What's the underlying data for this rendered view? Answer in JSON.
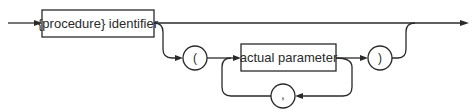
{
  "diagram": {
    "type": "syntax-diagram",
    "nodes": {
      "procedure_identifier": {
        "label": "{procedure} identifier",
        "kind": "nonterminal"
      },
      "open_paren": {
        "label": "(",
        "kind": "terminal"
      },
      "actual_parameter": {
        "label": "actual parameter",
        "kind": "nonterminal"
      },
      "comma": {
        "label": ",",
        "kind": "terminal"
      },
      "close_paren": {
        "label": ")",
        "kind": "terminal"
      }
    },
    "edges": [
      {
        "from": "entry",
        "to": "procedure_identifier"
      },
      {
        "from": "procedure_identifier",
        "to": "exit"
      },
      {
        "from": "procedure_identifier",
        "to": "open_paren"
      },
      {
        "from": "open_paren",
        "to": "actual_parameter"
      },
      {
        "from": "actual_parameter",
        "to": "close_paren"
      },
      {
        "from": "actual_parameter",
        "to": "comma"
      },
      {
        "from": "comma",
        "to": "actual_parameter"
      },
      {
        "from": "close_paren",
        "to": "exit"
      }
    ]
  }
}
